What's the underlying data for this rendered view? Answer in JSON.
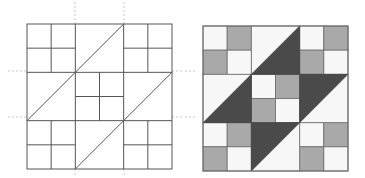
{
  "figure": {
    "colors": {
      "line": "#555555",
      "guide": "#c8c8c8",
      "dark": "#4a4a4a",
      "medium": "#a9a9a9",
      "light": "#f7f7f7",
      "background": "#ffffff"
    },
    "grid": "3x3 blocks; corners and center are four-patches; edge-middle blocks are half-square triangles",
    "outline_block": {
      "x": 27,
      "y": 24,
      "size": 145,
      "guides": {
        "horizontal_y": [
          71,
          117
        ],
        "vertical_x": [
          75,
          124
        ]
      }
    },
    "shaded_block": {
      "x": 203,
      "y": 26,
      "size": 145,
      "four_patch_pattern": [
        "light",
        "medium",
        "medium",
        "light"
      ],
      "triangles": {
        "top_middle": "dark lower-right",
        "middle_left": "dark lower-right",
        "middle_right": "dark upper-left",
        "bottom_middle": "dark upper-left"
      }
    }
  }
}
